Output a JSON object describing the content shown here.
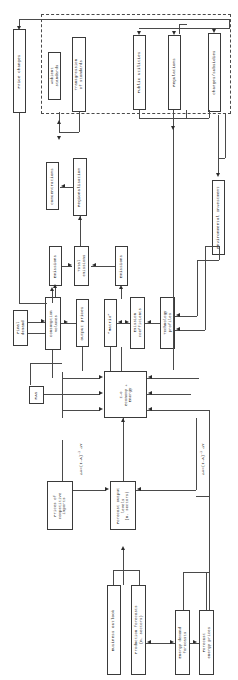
{
  "diagram": {
    "orientation": "text-rotated-90",
    "policy_envelope_label": "",
    "nodes": [
      {
        "id": "price-changes",
        "label": "Price changes"
      },
      {
        "id": "ambient-standards",
        "label": "Ambient\nstandards"
      },
      {
        "id": "transgression-standards",
        "label": "Transgression\nof standards"
      },
      {
        "id": "public-utilities",
        "label": "Public utilities"
      },
      {
        "id": "regulations",
        "label": "Regulations"
      },
      {
        "id": "charges-subsidies",
        "label": "Charges/subsidies"
      },
      {
        "id": "concentrations",
        "label": "Concentrations"
      },
      {
        "id": "regionalisation",
        "label": "Regionalisation"
      },
      {
        "id": "emissions-left",
        "label": "Emissions"
      },
      {
        "id": "total-emissions",
        "label": "Total\nemissions"
      },
      {
        "id": "emissions-right",
        "label": "Emissions"
      },
      {
        "id": "environmental-investment",
        "label": "Environmental Investment"
      },
      {
        "id": "final-demand",
        "label": "Final\ndemand"
      },
      {
        "id": "consumption-volumes",
        "label": "Consumption\nvolumes"
      },
      {
        "id": "output-prices",
        "label": "Output prices"
      },
      {
        "id": "matrix",
        "label": "“Matrix”"
      },
      {
        "id": "emission-coefficients",
        "label": "Emission\ncoefficients"
      },
      {
        "id": "technology-profiles",
        "label": "Technology\nprofiles"
      },
      {
        "id": "ras",
        "label": "RAS"
      },
      {
        "id": "io-economy-energy",
        "label": "I-O\nEconomy +\nEnergy"
      },
      {
        "id": "prices-competitive-imports",
        "label": "Prices of\ncompetitive\nimports"
      },
      {
        "id": "forecast-output-levels",
        "label": "Forecast output\nlevels\n(n. sectors)"
      },
      {
        "id": "business-outlook",
        "label": "Business outlook"
      },
      {
        "id": "production-forecasts",
        "label": "Production forecasts\n(n. sectors)"
      },
      {
        "id": "energy-demand-forecasts",
        "label": "Energy demand\nforecasts"
      },
      {
        "id": "forecast-energy-prices",
        "label": "Forecast\nenergy prices"
      }
    ],
    "annotations": [
      {
        "id": "delta-x-left",
        "text": "ΔX=(I-A)",
        "sup": "-1",
        "tail": " ΔY"
      },
      {
        "id": "delta-x-right",
        "text": "ΔX=(I-A)",
        "sup": "-1",
        "tail": " ΔY"
      }
    ],
    "colors": {
      "stroke": "#3a3a3a",
      "arrow": "#2b2b2b",
      "background": "#ffffff",
      "text": "#1a1a1a"
    }
  }
}
